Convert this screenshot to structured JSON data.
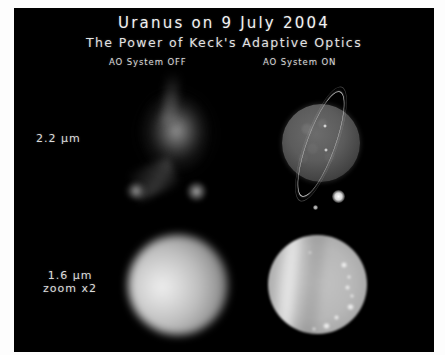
{
  "figure": {
    "title": "Uranus on 9 July 2004",
    "subtitle": "The Power of Keck's Adaptive Optics",
    "background_color": "#000000",
    "mount_color": "#fdfdfd",
    "text_color": "#e8e8e8"
  },
  "columns": [
    {
      "id": "ao-off",
      "header": "AO System OFF"
    },
    {
      "id": "ao-on",
      "header": "AO System ON"
    }
  ],
  "rows": [
    {
      "id": "band-22",
      "label": "2.2 μm",
      "label_line1": "2.2 μm",
      "label_line2": ""
    },
    {
      "id": "band-16",
      "label": "1.6 μm zoom x2",
      "label_line1": "1.6 μm",
      "label_line2": "zoom x2"
    }
  ],
  "panels": {
    "off_22": {
      "name": "uranus-2.2um-ao-off",
      "description": "diffuse blurred speckle blob with faint companion",
      "features": [
        "seeing-limited blob",
        "elongated tail",
        "companion point source"
      ]
    },
    "on_22": {
      "name": "uranus-2.2um-ao-on",
      "description": "sharp dark disk with bright tilted ring system and moons",
      "ring_tilt_degrees": 20,
      "visible_moons": 4,
      "features": [
        "epsilon ring",
        "limb mottling",
        "moons"
      ]
    },
    "off_16": {
      "name": "uranus-1.6um-ao-off",
      "description": "soft featureless bright disk, seeing limited",
      "features": [
        "no resolved detail"
      ]
    },
    "on_16": {
      "name": "uranus-1.6um-ao-on",
      "description": "banded disk with discrete bright cloud features",
      "visible_cloud_spots": 9,
      "features": [
        "bright limb band",
        "dark band",
        "cloud spots"
      ]
    }
  }
}
